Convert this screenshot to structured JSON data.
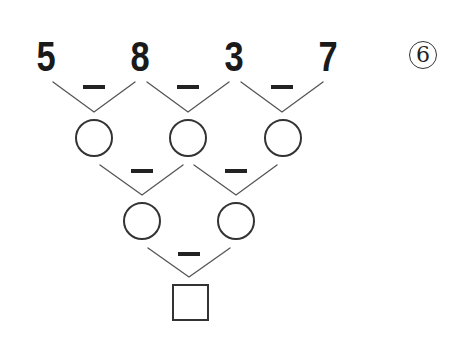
{
  "problem": {
    "label": "6",
    "label_style": "circled-number",
    "top_row": [
      "5",
      "8",
      "3",
      "7"
    ],
    "operation": "−",
    "operation_name": "subtract",
    "rows": [
      {
        "type": "numbers",
        "values": [
          "5",
          "8",
          "3",
          "7"
        ]
      },
      {
        "type": "answer-circles",
        "count": 3
      },
      {
        "type": "answer-circles",
        "count": 2
      },
      {
        "type": "answer-square",
        "count": 1
      }
    ]
  },
  "colors": {
    "ink": "#1a1a1a",
    "line": "#555555",
    "background": "#ffffff"
  }
}
